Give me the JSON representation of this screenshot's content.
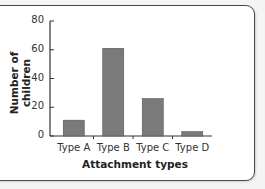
{
  "chart_data": {
    "type": "bar",
    "title": "",
    "categories": [
      "Type A",
      "Type B",
      "Type C",
      "Type D"
    ],
    "values": [
      11,
      61,
      26,
      3
    ],
    "xlabel": "Attachment types",
    "ylabel": "Number of children",
    "ylim": [
      0,
      80
    ],
    "yticks": [
      0,
      20,
      40,
      60,
      80
    ],
    "grid": false,
    "legend": null,
    "bar_color": "#7a7a7a"
  },
  "ytick_labels": [
    "80",
    "60",
    "40",
    "20",
    "0"
  ]
}
